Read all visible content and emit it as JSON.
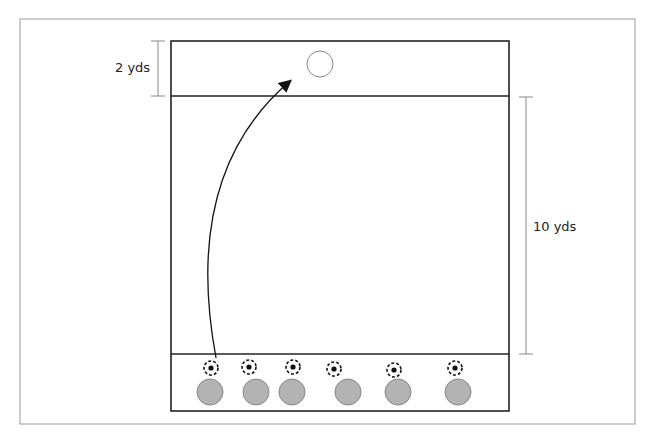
{
  "diagram": {
    "labels": {
      "top_zone": "2 yds",
      "middle_zone": "10 yds"
    },
    "players": [
      {
        "x": 210,
        "y": 392
      },
      {
        "x": 256,
        "y": 392
      },
      {
        "x": 292,
        "y": 392
      },
      {
        "x": 348,
        "y": 392
      },
      {
        "x": 398,
        "y": 392
      },
      {
        "x": 458,
        "y": 392
      }
    ],
    "balls": [
      {
        "x": 211,
        "y": 368
      },
      {
        "x": 249,
        "y": 367
      },
      {
        "x": 293,
        "y": 367
      },
      {
        "x": 334,
        "y": 369
      },
      {
        "x": 394,
        "y": 370
      },
      {
        "x": 455,
        "y": 368
      }
    ],
    "target": {
      "x": 320,
      "y": 64,
      "r": 13
    },
    "colors": {
      "player_fill": "#b3b3b3",
      "player_stroke": "#8a8a8a",
      "line": "#222222",
      "dimension_line": "#888888"
    }
  }
}
